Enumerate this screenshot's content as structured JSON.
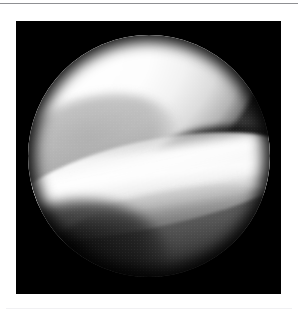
{
  "page": {
    "background_color": "#ffffff",
    "width": 298,
    "height": 315,
    "rule_top_color": "#8f9093",
    "rule_bottom_color": "#f1f1f3"
  },
  "figure": {
    "kind": "photograph",
    "modality": "arthroscopy",
    "caption": "",
    "frame_background": "#000000",
    "field_of_view": {
      "shape": "circle",
      "center_x": 149,
      "center_y": 156,
      "radius": 121
    },
    "regions": [
      {
        "name": "femoral-condyle",
        "description": "Large, brightly illuminated convex white articular surface occupying the upper-left two thirds of the circular field",
        "tone": "#ffffff",
        "brightness": "very-bright"
      },
      {
        "name": "joint-space-gap",
        "description": "Dark wedge-shaped joint space on the right where the condyle edge separates from the underlying structures",
        "tone": "#000000",
        "brightness": "black"
      },
      {
        "name": "meniscus-band",
        "description": "Bright diagonal band of meniscus / tibial articular cartilage crossing the middle of the field from lower-left to right",
        "tone": "#f4f4f4",
        "brightness": "bright"
      },
      {
        "name": "tissue-fold",
        "description": "Mid-grey soft tissue fold in the lower right portion of the field",
        "tone": "#525252",
        "brightness": "mid-grey"
      },
      {
        "name": "lower-left-shadow",
        "description": "Unlit dark shadow region in the lower-left of the circular field",
        "tone": "#0d0d0d",
        "brightness": "dark"
      },
      {
        "name": "scope-vignette",
        "description": "Black circular vignette edge of the arthroscope lens surrounded by the black frame",
        "tone": "#000000",
        "brightness": "black"
      }
    ]
  }
}
